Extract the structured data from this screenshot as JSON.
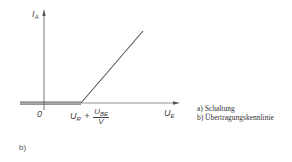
{
  "diagram": {
    "type": "transfer-characteristic",
    "y_axis": {
      "label": "I",
      "subscript": "A"
    },
    "x_axis": {
      "label": "U",
      "subscript": "E"
    },
    "origin_label": "0",
    "threshold_label": {
      "prefix": "U",
      "prefix_sub": "R",
      "plus": "+",
      "numerator": "U",
      "numerator_sub": "BE",
      "denominator": "V"
    },
    "figure_label": "b)"
  },
  "caption": {
    "line_a": "a) Schaltung",
    "line_b": "b) Übertragungskennlinie"
  },
  "colors": {
    "line": "#555555",
    "axis": "#777777",
    "text": "#333333"
  }
}
